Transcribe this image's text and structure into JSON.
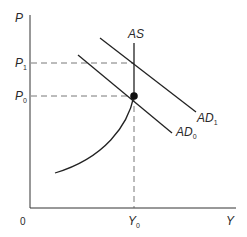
{
  "diagram": {
    "type": "economics AD-AS diagram",
    "axes": {
      "y_label": "P",
      "x_label": "Y",
      "origin_label": "0"
    },
    "price_levels": [
      {
        "label": "P",
        "sub": "1"
      },
      {
        "label": "P",
        "sub": "0"
      }
    ],
    "output_levels": [
      {
        "label": "Y",
        "sub": "0"
      }
    ],
    "curves": {
      "as": {
        "label": "AS"
      },
      "ad1": {
        "label": "AD",
        "sub": "1"
      },
      "ad0": {
        "label": "AD",
        "sub": "0"
      }
    },
    "equilibrium_point": {
      "at": "Y0, P0"
    },
    "colors": {
      "line": "#222222",
      "dash": "#555555"
    }
  }
}
